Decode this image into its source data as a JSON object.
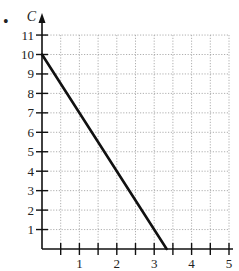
{
  "bullet": "•",
  "chart_data": {
    "type": "line",
    "title": "",
    "xlabel": "",
    "ylabel": "C",
    "xlim": [
      0,
      5
    ],
    "ylim": [
      0,
      11
    ],
    "x_ticks": [
      1,
      2,
      3,
      4,
      5
    ],
    "x_minor_step": 0.5,
    "y_ticks": [
      1,
      2,
      3,
      4,
      5,
      6,
      7,
      8,
      9,
      10,
      11
    ],
    "grid": true,
    "grid_style": "dotted",
    "series": [
      {
        "name": "C",
        "x": [
          0,
          3.333
        ],
        "y": [
          10,
          0
        ],
        "color": "#111111"
      }
    ]
  }
}
